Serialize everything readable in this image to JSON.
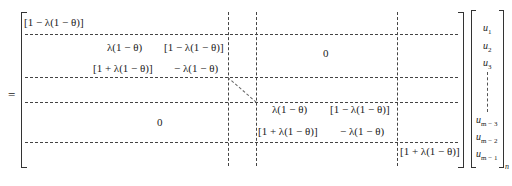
{
  "equation": {
    "equals_sign": "=",
    "matrix": {
      "block_r1c1": "[1 − λ(1 − θ)]",
      "block_r2": {
        "a11": "λ(1 − θ)",
        "a12": "[1 − λ(1 − θ)]",
        "a21": "[1 + λ(1 − θ)]",
        "a22": "− λ(1 − θ)"
      },
      "zero_top_right": "0",
      "zero_bottom_left": "0",
      "block_r4": {
        "a11": "λ(1 − θ)",
        "a12": "[1 − λ(1 − θ)]",
        "a21": "[1 + λ(1 − θ)]",
        "a22": "− λ(1 − θ)"
      },
      "block_last": "[1 + λ(1 − θ)]"
    },
    "vector": {
      "entries": [
        {
          "base": "u",
          "sub": "1"
        },
        {
          "base": "u",
          "sub": "2"
        },
        {
          "base": "u",
          "sub": "3"
        },
        {
          "base": "u",
          "sub": "m − 3"
        },
        {
          "base": "u",
          "sub": "m − 2"
        },
        {
          "base": "u",
          "sub": "m − 1"
        }
      ],
      "outer_subscript": "n"
    }
  }
}
